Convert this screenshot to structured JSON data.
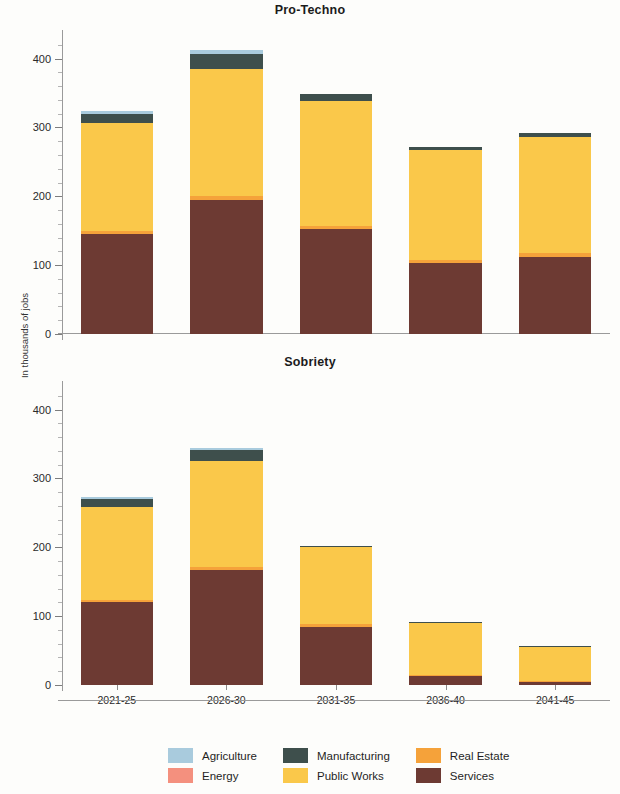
{
  "figure": {
    "ylabel": "In thousands of jobs",
    "ymin": 0,
    "ymax": 430,
    "ytick_labels": [
      "0",
      "100",
      "200",
      "300",
      "400"
    ],
    "ytick_values": [
      0,
      100,
      200,
      300,
      400
    ]
  },
  "legend": {
    "items": [
      {
        "label": "Agriculture",
        "color": "#a9cbdd"
      },
      {
        "label": "Energy",
        "color": "#f4907e"
      },
      {
        "label": "Manufacturing",
        "color": "#3e4f4c"
      },
      {
        "label": "Public Works",
        "color": "#fac84a"
      },
      {
        "label": "Real Estate",
        "color": "#f5a23a"
      },
      {
        "label": "Services",
        "color": "#6d3a33"
      }
    ]
  },
  "chart_data": [
    {
      "type": "bar",
      "stacked": true,
      "title": "Pro-Techno",
      "xlabel": "",
      "ylabel": "In thousands of jobs",
      "ylim": [
        0,
        430
      ],
      "grid": false,
      "legend_position": "bottom",
      "categories": [
        "2021-25",
        "2026-30",
        "2031-35",
        "2036-40",
        "2041-45"
      ],
      "series": [
        {
          "name": "Services",
          "color": "#6d3a33",
          "values": [
            145,
            195,
            152,
            103,
            112
          ]
        },
        {
          "name": "Real Estate",
          "color": "#f5a23a",
          "values": [
            5,
            6,
            5,
            4,
            5
          ]
        },
        {
          "name": "Public Works",
          "color": "#fac84a",
          "values": [
            157,
            184,
            181,
            161,
            169
          ]
        },
        {
          "name": "Manufacturing",
          "color": "#3e4f4c",
          "values": [
            13,
            22,
            10,
            4,
            6
          ]
        },
        {
          "name": "Agriculture",
          "color": "#a9cbdd",
          "values": [
            4,
            5,
            0,
            0,
            0
          ]
        },
        {
          "name": "Energy",
          "color": "#f4907e",
          "values": [
            0,
            0,
            0,
            0,
            0
          ]
        }
      ],
      "totals": [
        324,
        412,
        348,
        272,
        292
      ]
    },
    {
      "type": "bar",
      "stacked": true,
      "title": "Sobriety",
      "xlabel": "",
      "ylabel": "In thousands of jobs",
      "ylim": [
        0,
        430
      ],
      "grid": false,
      "legend_position": "bottom",
      "categories": [
        "2021-25",
        "2026-30",
        "2031-35",
        "2036-40",
        "2041-45"
      ],
      "series": [
        {
          "name": "Services",
          "color": "#6d3a33",
          "values": [
            120,
            167,
            85,
            13,
            5
          ]
        },
        {
          "name": "Real Estate",
          "color": "#f5a23a",
          "values": [
            4,
            5,
            3,
            1,
            1
          ]
        },
        {
          "name": "Public Works",
          "color": "#fac84a",
          "values": [
            134,
            153,
            112,
            77,
            49
          ]
        },
        {
          "name": "Manufacturing",
          "color": "#3e4f4c",
          "values": [
            12,
            16,
            2,
            1,
            1
          ]
        },
        {
          "name": "Agriculture",
          "color": "#a9cbdd",
          "values": [
            3,
            4,
            0,
            0,
            0
          ]
        },
        {
          "name": "Energy",
          "color": "#f4907e",
          "values": [
            0,
            0,
            0,
            0,
            0
          ]
        }
      ],
      "totals": [
        273,
        345,
        202,
        92,
        56
      ]
    }
  ]
}
